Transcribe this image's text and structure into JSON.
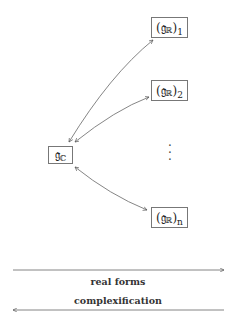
{
  "diagram": {
    "center_node": {
      "base": "𝔤",
      "sub": "ℂ"
    },
    "real_nodes": [
      {
        "base": "(𝔤",
        "sub_inner": "ℝ",
        "close": ")",
        "index": "1"
      },
      {
        "base": "(𝔤",
        "sub_inner": "ℝ",
        "close": ")",
        "index": "2"
      },
      {
        "base": "(𝔤",
        "sub_inner": "ℝ",
        "close": ")",
        "index": "n"
      }
    ],
    "ellipsis": "⋮",
    "legend": {
      "forward_label": "real forms",
      "backward_label": "complexification"
    },
    "colors": {
      "line": "#666666",
      "box_border": "#777777"
    }
  }
}
